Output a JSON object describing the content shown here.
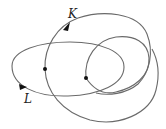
{
  "diagram": {
    "type": "link-diagram",
    "curves": [
      {
        "name": "K",
        "label": "K",
        "color": "#6a6a6a"
      },
      {
        "name": "L",
        "label": "L",
        "color": "#6a6a6a"
      }
    ],
    "labels": {
      "k": "K",
      "l": "L"
    },
    "marked_points": 2,
    "stroke_color": "#6a6a6a",
    "point_color": "#111111"
  }
}
